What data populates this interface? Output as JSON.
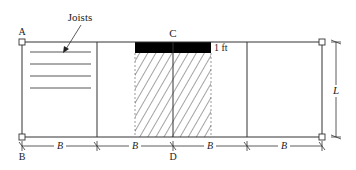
{
  "labels": {
    "joists": "Joists",
    "point_a": "A",
    "point_b": "B",
    "point_c": "C",
    "point_d": "D",
    "strip_width": "1 ft",
    "length": "L",
    "spacing": [
      "B",
      "B",
      "B",
      "B"
    ]
  },
  "colors": {
    "line": "#333333",
    "fill_black": "#000000",
    "background": "#ffffff"
  },
  "geometry": {
    "girder_positions_px": [
      22,
      97,
      173,
      247,
      322
    ],
    "top_y": 42,
    "bottom_y": 137,
    "tributary_area": {
      "x_start": 135,
      "x_end": 211
    }
  }
}
